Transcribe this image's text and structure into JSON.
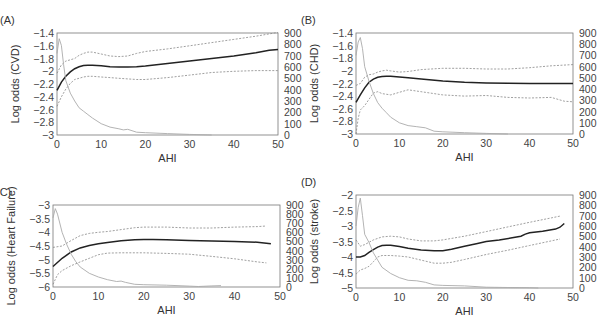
{
  "chart_data": [
    {
      "panel": "(A)",
      "type": "line",
      "title": "",
      "xlabel": "AHI",
      "ylabel": "Log odds (CVD)",
      "y2label": "",
      "xlim": [
        0,
        50
      ],
      "ylim": [
        -3,
        -1.4
      ],
      "y2lim": [
        0,
        900
      ],
      "xticks": [
        0,
        10,
        20,
        30,
        40,
        50
      ],
      "yticks": [
        -3,
        -2.8,
        -2.6,
        -2.4,
        -2.2,
        -2,
        -1.8,
        -1.6,
        -1.4
      ],
      "ytick_labels": [
        "−3",
        "−2.8",
        "−2.6",
        "−2.4",
        "−2.2",
        "−2",
        "−1.8",
        "−1.6",
        "−1.4"
      ],
      "y2ticks": [
        0,
        100,
        200,
        300,
        400,
        500,
        600,
        700,
        800,
        900
      ],
      "grid": false,
      "frame": {
        "x0": 57,
        "y0": 33,
        "x1": 278,
        "y1": 135
      },
      "series": [
        {
          "name": "Log odds estimate",
          "style": "solid-dark",
          "x": [
            0,
            1,
            2,
            3,
            4,
            5,
            6,
            7,
            8,
            10,
            12,
            14,
            16,
            18,
            20,
            25,
            30,
            35,
            40,
            45,
            48,
            50
          ],
          "y": [
            -2.3,
            -2.17,
            -2.08,
            -2.01,
            -1.96,
            -1.93,
            -1.91,
            -1.905,
            -1.905,
            -1.915,
            -1.93,
            -1.935,
            -1.935,
            -1.93,
            -1.92,
            -1.88,
            -1.84,
            -1.8,
            -1.76,
            -1.71,
            -1.67,
            -1.66
          ]
        },
        {
          "name": "Upper 95% CI",
          "style": "dotted",
          "x": [
            0,
            1,
            2,
            3,
            4,
            5,
            6,
            7,
            8,
            10,
            12,
            14,
            16,
            18,
            20,
            25,
            30,
            35,
            40,
            45,
            50
          ],
          "y": [
            -2.03,
            -1.9,
            -1.84,
            -1.82,
            -1.8,
            -1.75,
            -1.72,
            -1.7,
            -1.7,
            -1.73,
            -1.76,
            -1.77,
            -1.76,
            -1.72,
            -1.69,
            -1.65,
            -1.6,
            -1.55,
            -1.5,
            -1.45,
            -1.39
          ]
        },
        {
          "name": "Lower 95% CI",
          "style": "dotted",
          "x": [
            0,
            1,
            2,
            3,
            4,
            5,
            6,
            7,
            8,
            10,
            12,
            14,
            16,
            18,
            20,
            25,
            30,
            35,
            40,
            45,
            50
          ],
          "y": [
            -2.55,
            -2.4,
            -2.28,
            -2.19,
            -2.13,
            -2.11,
            -2.09,
            -2.08,
            -2.08,
            -2.09,
            -2.1,
            -2.11,
            -2.12,
            -2.13,
            -2.13,
            -2.1,
            -2.06,
            -2.02,
            -2.0,
            -1.99,
            -1.99
          ]
        },
        {
          "name": "Histogram (count, right axis)",
          "style": "grey",
          "axis": "y2",
          "x": [
            0,
            0.5,
            1,
            1.5,
            2,
            3,
            4,
            5,
            6,
            7,
            8,
            10,
            12,
            14,
            15,
            16,
            18,
            20,
            25,
            30,
            35
          ],
          "y": [
            720,
            850,
            790,
            620,
            480,
            370,
            300,
            240,
            210,
            180,
            150,
            100,
            70,
            55,
            45,
            50,
            25,
            20,
            12,
            5,
            0
          ]
        }
      ]
    },
    {
      "panel": "(B)",
      "type": "line",
      "title": "",
      "xlabel": "AHI",
      "ylabel": "Log odds (CHD)",
      "xlim": [
        0,
        50
      ],
      "ylim": [
        -3,
        -1.4
      ],
      "y2lim": [
        0,
        900
      ],
      "xticks": [
        0,
        10,
        20,
        30,
        40,
        50
      ],
      "yticks": [
        -3,
        -2.8,
        -2.6,
        -2.4,
        -2.2,
        -2,
        -1.8,
        -1.6,
        -1.4
      ],
      "ytick_labels": [
        "−3",
        "−2.8",
        "−2.6",
        "−2.4",
        "−2.2",
        "−2",
        "−1.8",
        "−1.6",
        "−1.4"
      ],
      "y2ticks": [
        0,
        100,
        200,
        300,
        400,
        500,
        600,
        700,
        800,
        900
      ],
      "grid": false,
      "frame": {
        "x0": 356,
        "y0": 33,
        "x1": 573,
        "y1": 134
      },
      "series": [
        {
          "name": "Log odds estimate",
          "style": "solid-dark",
          "x": [
            0,
            1,
            2,
            3,
            4,
            5,
            6,
            7,
            8,
            10,
            12,
            15,
            20,
            25,
            30,
            35,
            40,
            45,
            50
          ],
          "y": [
            -2.5,
            -2.38,
            -2.27,
            -2.18,
            -2.13,
            -2.1,
            -2.09,
            -2.085,
            -2.085,
            -2.095,
            -2.11,
            -2.13,
            -2.16,
            -2.18,
            -2.19,
            -2.195,
            -2.2,
            -2.2,
            -2.2
          ]
        },
        {
          "name": "Upper 95% CI",
          "style": "dotted",
          "x": [
            0,
            1,
            2,
            3,
            4,
            5,
            6,
            7,
            8,
            10,
            12,
            15,
            20,
            25,
            30,
            35,
            40,
            45,
            50
          ],
          "y": [
            -2.23,
            -2.2,
            -2.1,
            -2.06,
            -2.05,
            -2.02,
            -2.0,
            -1.99,
            -2.0,
            -2.02,
            -2.01,
            -1.98,
            -1.96,
            -1.96,
            -1.97,
            -1.97,
            -1.95,
            -1.92,
            -1.9
          ]
        },
        {
          "name": "Lower 95% CI",
          "style": "dotted",
          "x": [
            0,
            0.5,
            1,
            2,
            3,
            4,
            5,
            6,
            8,
            10,
            12,
            15,
            20,
            25,
            30,
            35,
            40,
            45,
            48,
            50
          ],
          "y": [
            -3.0,
            -2.75,
            -2.62,
            -2.55,
            -2.45,
            -2.35,
            -2.33,
            -2.36,
            -2.38,
            -2.34,
            -2.3,
            -2.33,
            -2.38,
            -2.4,
            -2.39,
            -2.42,
            -2.43,
            -2.42,
            -2.48,
            -2.49
          ]
        },
        {
          "name": "Histogram (count, right axis)",
          "style": "grey",
          "axis": "y2",
          "x": [
            0,
            0.5,
            1,
            1.5,
            2,
            3,
            4,
            5,
            6,
            7,
            8,
            10,
            12,
            14,
            16,
            18,
            20,
            25,
            30,
            35
          ],
          "y": [
            700,
            820,
            860,
            760,
            600,
            470,
            360,
            280,
            230,
            190,
            150,
            100,
            75,
            65,
            55,
            25,
            20,
            12,
            5,
            0
          ]
        }
      ]
    },
    {
      "panel": "(C)",
      "type": "line",
      "title": "",
      "xlabel": "AHI",
      "ylabel": "Log odds (Heart Failure)",
      "xlim": [
        0,
        50
      ],
      "ylim": [
        -6,
        -3
      ],
      "y2lim": [
        0,
        900
      ],
      "xticks": [
        0,
        10,
        20,
        30,
        40,
        50
      ],
      "yticks": [
        -6,
        -5.5,
        -5,
        -4.5,
        -4,
        -3.5,
        -3
      ],
      "ytick_labels": [
        "−6",
        "−5.5",
        "−5",
        "−4.5",
        "−4",
        "−3.5",
        "−3"
      ],
      "y2ticks": [
        0,
        100,
        200,
        300,
        400,
        500,
        600,
        700,
        800,
        900
      ],
      "grid": false,
      "frame": {
        "x0": 53,
        "y0": 205,
        "x1": 280,
        "y1": 287
      },
      "series": [
        {
          "name": "Log odds estimate",
          "style": "solid-dark",
          "x": [
            0,
            2,
            4,
            6,
            8,
            10,
            12,
            15,
            18,
            20,
            22,
            25,
            30,
            35,
            40,
            45,
            48
          ],
          "y": [
            -5.25,
            -4.95,
            -4.72,
            -4.57,
            -4.48,
            -4.42,
            -4.37,
            -4.31,
            -4.27,
            -4.26,
            -4.26,
            -4.27,
            -4.3,
            -4.32,
            -4.33,
            -4.36,
            -4.42
          ]
        },
        {
          "name": "Upper 95% CI",
          "style": "dotted",
          "x": [
            0,
            2,
            4,
            6,
            8,
            10,
            12,
            15,
            18,
            20,
            25,
            30,
            35,
            40,
            45,
            47
          ],
          "y": [
            -4.55,
            -4.5,
            -4.3,
            -4.12,
            -4.04,
            -4.0,
            -3.97,
            -3.9,
            -3.83,
            -3.81,
            -3.81,
            -3.84,
            -3.84,
            -3.81,
            -3.79,
            -3.77
          ]
        },
        {
          "name": "Lower 95% CI",
          "style": "dotted",
          "x": [
            0,
            1,
            2,
            4,
            6,
            8,
            10,
            12,
            15,
            20,
            25,
            30,
            35,
            40,
            45,
            47
          ],
          "y": [
            -5.9,
            -5.55,
            -5.4,
            -5.22,
            -5.08,
            -4.95,
            -4.82,
            -4.76,
            -4.75,
            -4.75,
            -4.77,
            -4.8,
            -4.88,
            -4.97,
            -5.08,
            -5.12
          ]
        },
        {
          "name": "Histogram (count, right axis)",
          "style": "grey",
          "axis": "y2",
          "x": [
            0,
            0.5,
            1,
            2,
            3,
            4,
            5,
            6,
            8,
            10,
            12,
            14,
            15,
            16,
            18,
            20,
            25,
            30,
            32,
            35,
            37
          ],
          "y": [
            760,
            860,
            800,
            600,
            470,
            360,
            280,
            220,
            150,
            110,
            80,
            60,
            65,
            50,
            30,
            25,
            20,
            10,
            5,
            12,
            15
          ]
        }
      ]
    },
    {
      "panel": "(D)",
      "type": "line",
      "title": "",
      "xlabel": "AHI",
      "ylabel": "Log odds (stroke)",
      "xlim": [
        0,
        50
      ],
      "ylim": [
        -5,
        -2
      ],
      "y2lim": [
        0,
        900
      ],
      "xticks": [
        0,
        10,
        20,
        30,
        40,
        50
      ],
      "yticks": [
        -5,
        -4.5,
        -4,
        -3.5,
        -3,
        -2.5,
        -2
      ],
      "ytick_labels": [
        "−5",
        "−4.5",
        "−4",
        "−3.5",
        "−3",
        "−2.5",
        "−2"
      ],
      "y2ticks": [
        0,
        100,
        200,
        300,
        400,
        500,
        600,
        700,
        800,
        900
      ],
      "grid": false,
      "frame": {
        "x0": 356,
        "y0": 195,
        "x1": 573,
        "y1": 288
      },
      "series": [
        {
          "name": "Log odds estimate",
          "style": "solid-dark",
          "x": [
            0,
            1,
            2,
            3,
            4,
            5,
            6,
            7,
            8,
            10,
            12,
            15,
            18,
            20,
            22,
            25,
            28,
            30,
            33,
            36,
            38,
            39,
            40,
            43,
            46,
            47,
            48
          ],
          "y": [
            -4.0,
            -4.0,
            -3.95,
            -3.85,
            -3.76,
            -3.68,
            -3.63,
            -3.62,
            -3.62,
            -3.66,
            -3.72,
            -3.77,
            -3.8,
            -3.8,
            -3.75,
            -3.65,
            -3.56,
            -3.5,
            -3.45,
            -3.38,
            -3.33,
            -3.26,
            -3.22,
            -3.17,
            -3.1,
            -3.04,
            -2.92
          ]
        },
        {
          "name": "Upper 95% CI",
          "style": "dotted",
          "x": [
            0,
            1,
            2,
            4,
            6,
            8,
            10,
            12,
            15,
            18,
            20,
            25,
            30,
            35,
            40,
            45,
            47
          ],
          "y": [
            -3.45,
            -3.65,
            -3.6,
            -3.45,
            -3.35,
            -3.33,
            -3.35,
            -3.42,
            -3.48,
            -3.48,
            -3.45,
            -3.33,
            -3.18,
            -3.03,
            -2.88,
            -2.74,
            -2.68
          ]
        },
        {
          "name": "Lower 95% CI",
          "style": "dotted",
          "x": [
            0,
            1,
            2,
            3,
            4,
            5,
            6,
            8,
            10,
            12,
            15,
            18,
            20,
            22,
            25,
            30,
            35,
            40,
            45,
            47
          ],
          "y": [
            -4.55,
            -4.42,
            -4.37,
            -4.3,
            -4.15,
            -4.0,
            -3.95,
            -3.95,
            -3.97,
            -4.0,
            -4.1,
            -4.2,
            -4.2,
            -4.17,
            -4.08,
            -3.92,
            -3.78,
            -3.63,
            -3.48,
            -3.42
          ]
        },
        {
          "name": "Histogram (count, right axis)",
          "style": "grey",
          "axis": "y2",
          "x": [
            0,
            0.5,
            1,
            1.5,
            2,
            3,
            4,
            5,
            6,
            8,
            10,
            12,
            14,
            16,
            18,
            20,
            25,
            30,
            35,
            40,
            42
          ],
          "y": [
            600,
            780,
            870,
            700,
            520,
            440,
            340,
            270,
            200,
            140,
            100,
            75,
            70,
            55,
            30,
            25,
            20,
            8,
            5,
            3,
            0
          ]
        }
      ]
    }
  ]
}
